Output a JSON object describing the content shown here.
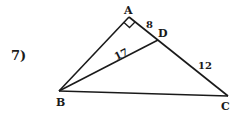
{
  "problem": {
    "number_label": "7)"
  },
  "figure": {
    "vertices": {
      "A": {
        "label": "A",
        "x": 129,
        "y": 17
      },
      "B": {
        "label": "B",
        "x": 59,
        "y": 91
      },
      "C": {
        "label": "C",
        "x": 228,
        "y": 96
      },
      "D": {
        "label": "D",
        "x": 158,
        "y": 40
      }
    },
    "segments": [
      {
        "from": "A",
        "to": "B"
      },
      {
        "from": "A",
        "to": "C"
      },
      {
        "from": "B",
        "to": "C"
      },
      {
        "from": "B",
        "to": "D"
      }
    ],
    "right_angle_at": "A",
    "measurements": {
      "AD": "8",
      "BD": "17",
      "DC": "12"
    }
  }
}
